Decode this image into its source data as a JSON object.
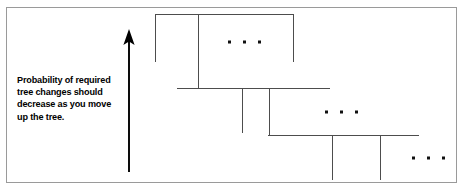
{
  "figure": {
    "width": 464,
    "height": 191,
    "background": "#ffffff",
    "border_color": "#9a9a9a",
    "line_color": "#4d4d4d",
    "arrow_color": "#000000",
    "text_color": "#000000"
  },
  "caption": {
    "lines": [
      "Probability of required",
      "tree changes should",
      "decrease as you move",
      "up the tree."
    ],
    "full_text": "Probability of required tree changes should decrease as you move up the tree."
  },
  "arrow": {
    "direction": "up",
    "x": 129,
    "y_top": 29,
    "y_bottom": 172
  },
  "tree": {
    "levels": [
      {
        "name": "level-1",
        "horizontal": {
          "x1": 155,
          "x2": 294,
          "y": 14
        },
        "verticals": [
          {
            "x": 155,
            "y1": 14,
            "y2": 62
          },
          {
            "x": 198,
            "y1": 14,
            "y2": 88
          },
          {
            "x": 294,
            "y1": 14,
            "y2": 62
          }
        ],
        "ellipsis": {
          "cx": 243,
          "cy": 42,
          "count": 3,
          "spacing": 15,
          "size": 3
        }
      },
      {
        "name": "level-2",
        "horizontal": {
          "x1": 177,
          "x2": 330,
          "y": 88
        },
        "verticals": [
          {
            "x": 242,
            "y1": 88,
            "y2": 133
          },
          {
            "x": 270,
            "y1": 88,
            "y2": 135
          }
        ],
        "ellipsis": {
          "cx": 340,
          "cy": 112,
          "count": 3,
          "spacing": 15,
          "size": 3
        }
      },
      {
        "name": "level-3",
        "horizontal": {
          "x1": 268,
          "x2": 419,
          "y": 135
        },
        "verticals": [
          {
            "x": 332,
            "y1": 135,
            "y2": 180
          },
          {
            "x": 380,
            "y1": 135,
            "y2": 180
          }
        ],
        "ellipsis": {
          "cx": 427,
          "cy": 158,
          "count": 3,
          "spacing": 15,
          "size": 3
        }
      }
    ]
  }
}
